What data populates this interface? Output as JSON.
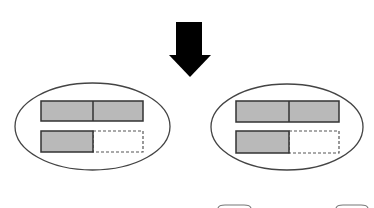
{
  "diagram": {
    "colors": {
      "background": "#ffffff",
      "arrow": "#000000",
      "outline": "#444444",
      "bar_fill": "#b9b9b9",
      "bar_border": "#333333",
      "dashed_border": "#555555"
    },
    "arrow": {
      "direction": "down",
      "shaft": {
        "x": 176,
        "y": 22,
        "w": 26,
        "h": 33
      },
      "head": {
        "left": 169,
        "right": 211,
        "top": 55,
        "tip_y": 77
      }
    },
    "groups": [
      {
        "id": "left",
        "ellipse": {
          "cx": 92.5,
          "cy": 126.5,
          "rx": 77.5,
          "ry": 43.5
        },
        "top_bar": {
          "x": 41,
          "y": 101,
          "w": 102,
          "h": 20,
          "divider_x": 93
        },
        "bottom_bar": {
          "x": 41,
          "y": 131,
          "w": 102,
          "h": 21,
          "filled_w": 52
        }
      },
      {
        "id": "right",
        "ellipse": {
          "cx": 287,
          "cy": 127,
          "rx": 76,
          "ry": 43
        },
        "top_bar": {
          "x": 236,
          "y": 101,
          "w": 103,
          "h": 21,
          "divider_x": 289
        },
        "bottom_bar": {
          "x": 236,
          "y": 131,
          "w": 103,
          "h": 22,
          "filled_w": 53
        }
      }
    ],
    "partial_shapes_bottom": [
      {
        "x1": 218,
        "x2": 251,
        "y": 206
      },
      {
        "x1": 336,
        "x2": 368,
        "y": 206
      }
    ]
  }
}
